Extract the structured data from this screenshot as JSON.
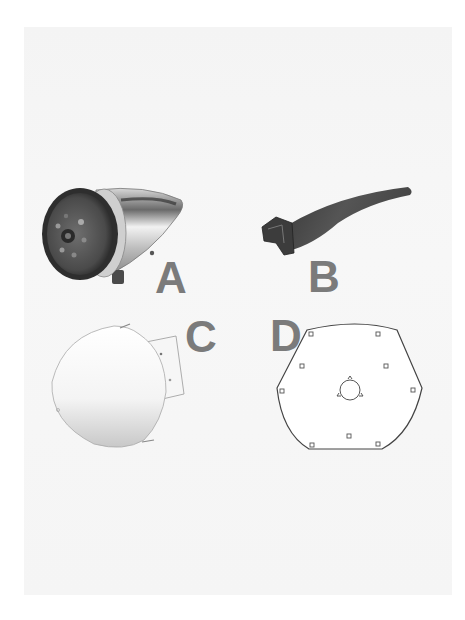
{
  "figure": {
    "background_color": "#f5f5f5",
    "label_color": "#7b7b7b",
    "parts": [
      {
        "id": "A",
        "label": "A",
        "description": "hub assembly with nose cone"
      },
      {
        "id": "B",
        "label": "B",
        "description": "blade"
      },
      {
        "id": "C",
        "label": "C",
        "description": "nose cone shell"
      },
      {
        "id": "D",
        "label": "D",
        "description": "mounting plate"
      }
    ]
  }
}
